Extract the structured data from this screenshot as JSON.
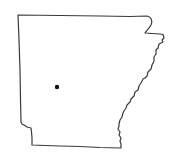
{
  "map": {
    "region": "Arkansas",
    "outline_color": "#3a3a3a",
    "fill_color": "#ffffff",
    "background": "#ffffff",
    "marker": {
      "x": 57,
      "y": 87,
      "radius": 2.2,
      "color": "#111111"
    }
  }
}
